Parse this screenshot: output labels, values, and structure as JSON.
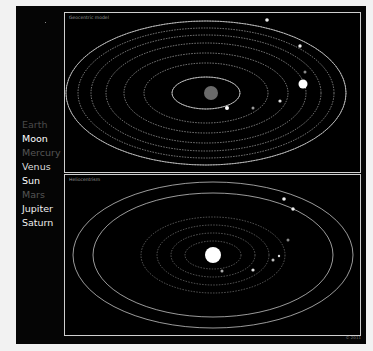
{
  "legend": {
    "items": [
      {
        "label": "Earth",
        "color": "#4a4a4a"
      },
      {
        "label": "Moon",
        "color": "#ffffff"
      },
      {
        "label": "Mercury",
        "color": "#555555"
      },
      {
        "label": "Venus",
        "color": "#dddddd"
      },
      {
        "label": "Sun",
        "color": "#ffffff"
      },
      {
        "label": "Mars",
        "color": "#555555"
      },
      {
        "label": "Jupiter",
        "color": "#eeeeee"
      },
      {
        "label": "Saturn",
        "color": "#eeeeee"
      }
    ]
  },
  "panels": {
    "top": {
      "title": "Geocentric model",
      "center_body": "Earth"
    },
    "bottom": {
      "title": "Heliocentrism",
      "center_body": "Sun"
    }
  },
  "credit": "© 2011"
}
